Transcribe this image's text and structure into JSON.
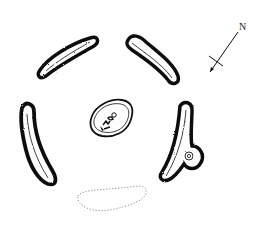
{
  "diagram": {
    "type": "site-plan",
    "colors": {
      "ink": "#111111",
      "background": "#ffffff",
      "dotted": "#777777"
    },
    "north_arrow": {
      "label": "N",
      "icon": "north-arrow-icon"
    },
    "features": [
      {
        "id": "upper-left-bank",
        "kind": "curved-bank"
      },
      {
        "id": "upper-right-bank",
        "kind": "curved-bank"
      },
      {
        "id": "left-bank",
        "kind": "curved-bank"
      },
      {
        "id": "right-bank",
        "kind": "curved-bank-with-annex"
      },
      {
        "id": "central-feature",
        "kind": "oval-enclosure"
      },
      {
        "id": "southern-dotted-feature",
        "kind": "dotted-outline"
      }
    ]
  }
}
